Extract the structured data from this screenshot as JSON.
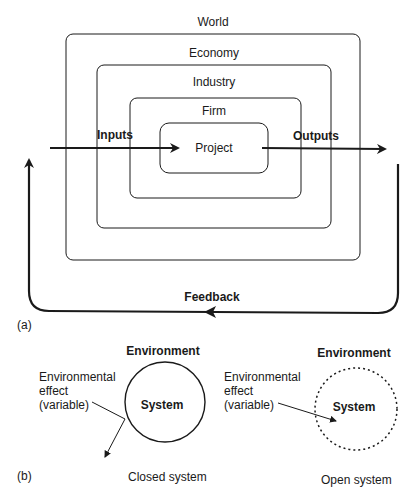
{
  "part_a": {
    "panel_label": "(a)",
    "layers": [
      {
        "name": "World"
      },
      {
        "name": "Economy"
      },
      {
        "name": "Industry"
      },
      {
        "name": "Firm"
      },
      {
        "name": "Project"
      }
    ],
    "inputs_label": "Inputs",
    "outputs_label": "Outputs",
    "feedback_label": "Feedback"
  },
  "part_b": {
    "panel_label": "(b)",
    "closed": {
      "environment_label": "Environment",
      "effect_label_line1": "Environmental",
      "effect_label_line2": "effect",
      "effect_label_line3": "(variable)",
      "system_label": "System",
      "caption": "Closed system"
    },
    "open": {
      "environment_label": "Environment",
      "effect_label_line1": "Environmental",
      "effect_label_line2": "effect",
      "effect_label_line3": "(variable)",
      "system_label": "System",
      "caption": "Open system"
    }
  },
  "colors": {
    "stroke": "#1a1a1a",
    "background": "#ffffff"
  }
}
